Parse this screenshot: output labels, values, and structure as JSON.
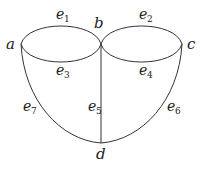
{
  "diagram": {
    "type": "graph",
    "vertices": [
      {
        "id": "a",
        "label": "a",
        "x": 21,
        "y": 44
      },
      {
        "id": "b",
        "label": "b",
        "x": 101,
        "y": 44
      },
      {
        "id": "c",
        "label": "c",
        "x": 182,
        "y": 44
      },
      {
        "id": "d",
        "label": "d",
        "x": 101,
        "y": 143
      }
    ],
    "edges": [
      {
        "id": "e1",
        "label": "e",
        "sub": "1",
        "from": "a",
        "to": "b",
        "shape": "upper arc"
      },
      {
        "id": "e2",
        "label": "e",
        "sub": "2",
        "from": "b",
        "to": "c",
        "shape": "upper arc"
      },
      {
        "id": "e3",
        "label": "e",
        "sub": "3",
        "from": "a",
        "to": "b",
        "shape": "lower arc"
      },
      {
        "id": "e4",
        "label": "e",
        "sub": "4",
        "from": "b",
        "to": "c",
        "shape": "lower arc"
      },
      {
        "id": "e5",
        "label": "e",
        "sub": "5",
        "from": "b",
        "to": "d",
        "shape": "straight"
      },
      {
        "id": "e6",
        "label": "e",
        "sub": "6",
        "from": "c",
        "to": "d",
        "shape": "curve"
      },
      {
        "id": "e7",
        "label": "e",
        "sub": "7",
        "from": "a",
        "to": "d",
        "shape": "curve"
      }
    ],
    "stroke_color": "#333333"
  }
}
